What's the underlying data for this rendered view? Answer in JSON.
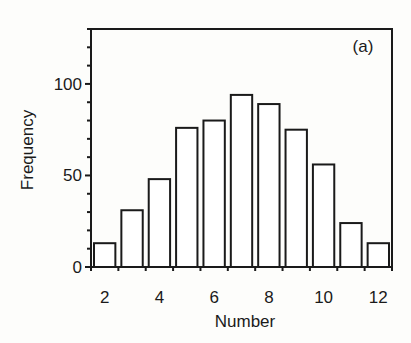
{
  "chart_data": {
    "type": "bar",
    "title": "",
    "annotation": "(a)",
    "xlabel": "Number",
    "ylabel": "Frequency",
    "categories": [
      "2",
      "3",
      "4",
      "5",
      "6",
      "7",
      "8",
      "9",
      "10",
      "11",
      "12"
    ],
    "values": [
      13,
      31,
      48,
      76,
      80,
      94,
      89,
      75,
      56,
      24,
      13
    ],
    "x_tick_labels": [
      "2",
      "4",
      "6",
      "8",
      "10",
      "12"
    ],
    "y_tick_labels": [
      "0",
      "50",
      "100"
    ],
    "ylim": [
      0,
      130
    ],
    "y_minor_tick_step": 10,
    "grid": false,
    "legend": null,
    "bar_fill": "#ffffff",
    "bar_stroke": "#1a1a1a"
  }
}
